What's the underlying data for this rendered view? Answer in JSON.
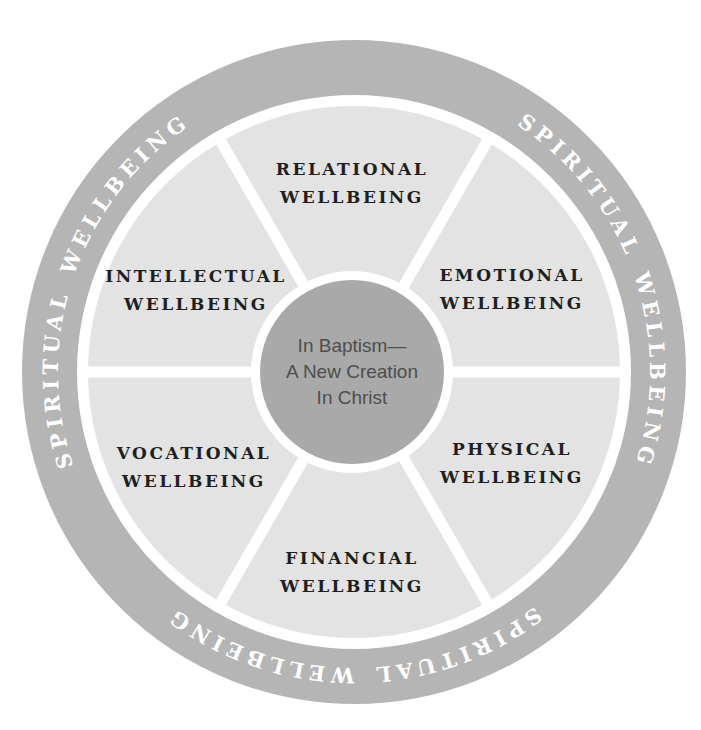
{
  "diagram": {
    "name": "wellbeing-wheel",
    "ring": {
      "label": "SPIRITUAL WELLBEING",
      "repetitions": 3
    },
    "segments": [
      {
        "id": "relational",
        "line1": "RELATIONAL",
        "line2": "WELLBEING"
      },
      {
        "id": "emotional",
        "line1": "EMOTIONAL",
        "line2": "WELLBEING"
      },
      {
        "id": "physical",
        "line1": "PHYSICAL",
        "line2": "WELLBEING"
      },
      {
        "id": "financial",
        "line1": "FINANCIAL",
        "line2": "WELLBEING"
      },
      {
        "id": "vocational",
        "line1": "VOCATIONAL",
        "line2": "WELLBEING"
      },
      {
        "id": "intellectual",
        "line1": "INTELLECTUAL",
        "line2": "WELLBEING"
      }
    ],
    "center": {
      "line1": "In Baptism—",
      "line2": "A New Creation",
      "line3": "In Christ"
    },
    "colors": {
      "ring": "#b5b5b5",
      "ring_text": "#ffffff",
      "segment": "#e3e3e3",
      "separator": "#ffffff",
      "hub_ring": "#ffffff",
      "center": "#a9a9a9",
      "center_text": "#4e4e4e",
      "segment_text": "#1f1f1f",
      "background": "#ffffff"
    }
  }
}
